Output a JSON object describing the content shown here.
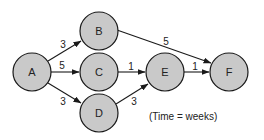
{
  "diagram": {
    "type": "network-activity-diagram",
    "caption": "(Time = weeks)",
    "node_fill": "#c9c9c9",
    "stroke_color": "#1a1a1a",
    "nodes": [
      {
        "id": "A",
        "label": "A",
        "cx": 32,
        "cy": 72,
        "r": 19
      },
      {
        "id": "B",
        "label": "B",
        "cx": 99,
        "cy": 31,
        "r": 19
      },
      {
        "id": "C",
        "label": "C",
        "cx": 99,
        "cy": 72,
        "r": 19
      },
      {
        "id": "D",
        "label": "D",
        "cx": 99,
        "cy": 113,
        "r": 19
      },
      {
        "id": "E",
        "label": "E",
        "cx": 165,
        "cy": 72,
        "r": 19
      },
      {
        "id": "F",
        "label": "F",
        "cx": 229,
        "cy": 72,
        "r": 19
      }
    ],
    "edges": [
      {
        "from": "A",
        "to": "B",
        "weight": "3"
      },
      {
        "from": "A",
        "to": "C",
        "weight": "5"
      },
      {
        "from": "A",
        "to": "D",
        "weight": "3"
      },
      {
        "from": "B",
        "to": "F",
        "weight": "5"
      },
      {
        "from": "C",
        "to": "E",
        "weight": "1"
      },
      {
        "from": "D",
        "to": "E",
        "weight": "3"
      },
      {
        "from": "E",
        "to": "F",
        "weight": "1"
      }
    ]
  }
}
